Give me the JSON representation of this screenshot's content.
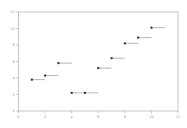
{
  "chart_data": {
    "type": "scatter",
    "title": "",
    "subtitle": "",
    "xlabel": "",
    "ylabel": "",
    "xlim": [
      0,
      12
    ],
    "ylim": [
      0,
      12
    ],
    "grid": false,
    "legend": null,
    "legend_position": "none",
    "xticks": [
      0,
      2,
      4,
      6,
      8,
      10,
      12
    ],
    "yticks": [
      0,
      2,
      4,
      6,
      8,
      10,
      12
    ],
    "xtick_labels": [
      "0",
      "2",
      "4",
      "6",
      "8",
      "10",
      "12"
    ],
    "ytick_labels": [
      "0",
      "2",
      "4",
      "6",
      "8",
      "10",
      "12"
    ],
    "marker_style": "square",
    "marker_color": "#2b2b2b",
    "segment_color": "#9e9e9e",
    "axis_color": "#b0b0b0",
    "tick_label_color": "#9a9a9a",
    "background_color": "#ffffff",
    "series": [
      {
        "name": "series-1",
        "segment_span": 1.0,
        "points": [
          {
            "x": 1,
            "y": 3.8,
            "x_end": 2.0
          },
          {
            "x": 2,
            "y": 4.3,
            "x_end": 3.0
          },
          {
            "x": 3,
            "y": 5.8,
            "x_end": 4.0
          },
          {
            "x": 4,
            "y": 2.2,
            "x_end": 5.0
          },
          {
            "x": 5,
            "y": 2.2,
            "x_end": 6.0
          },
          {
            "x": 6,
            "y": 5.2,
            "x_end": 7.0
          },
          {
            "x": 7,
            "y": 6.4,
            "x_end": 8.0
          },
          {
            "x": 8,
            "y": 8.2,
            "x_end": 9.0
          },
          {
            "x": 9,
            "y": 8.9,
            "x_end": 10.0
          },
          {
            "x": 10,
            "y": 10.1,
            "x_end": 11.0
          }
        ]
      }
    ]
  }
}
